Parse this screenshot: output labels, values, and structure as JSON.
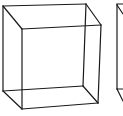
{
  "figure": {
    "stroke_color": "#1a1a1a",
    "background": "#ffffff",
    "stroke_width": 1.2
  },
  "cubes": [
    {
      "name": "cube-1",
      "vertices": {
        "back_top_left": [
          3,
          6
        ],
        "back_top_right": [
          86,
          4
        ],
        "back_bottom_left": [
          3,
          91
        ],
        "back_bottom_right": [
          83,
          86
        ],
        "front_top_left": [
          22,
          29
        ],
        "front_top_right": [
          101,
          25
        ],
        "front_bottom_left": [
          22,
          109
        ],
        "front_bottom_right": [
          98,
          103
        ]
      }
    },
    {
      "name": "cube-2-partial",
      "segments": [
        [
          [
            117,
            4
          ],
          [
            117,
            89
          ]
        ],
        [
          [
            117,
            4
          ],
          [
            123,
            4
          ]
        ],
        [
          [
            117,
            5
          ],
          [
            123,
            14
          ]
        ],
        [
          [
            117,
            89
          ],
          [
            123,
            89
          ]
        ],
        [
          [
            117,
            89
          ],
          [
            123,
            101
          ]
        ]
      ]
    }
  ]
}
